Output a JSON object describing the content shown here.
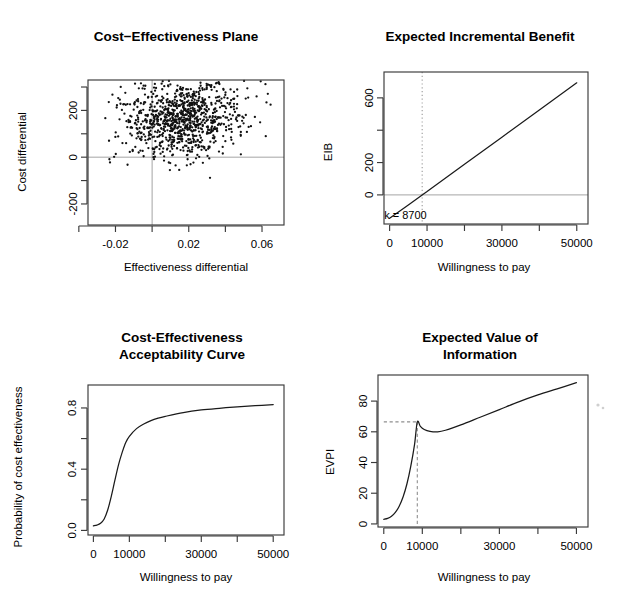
{
  "figure": {
    "background_color": "#ffffff",
    "foreground_color": "#000000",
    "grid_layout": "2x2",
    "reference_line_color": "#9a9a9a"
  },
  "chart_data": [
    {
      "id": "cost-effectiveness-plane",
      "type": "scatter",
      "title": "Cost−Effectiveness Plane",
      "xlabel": "Effectiveness differential",
      "ylabel": "Cost differential",
      "xlim": [
        -0.035,
        0.072
      ],
      "ylim": [
        -290,
        330
      ],
      "xticks": [
        -0.04,
        -0.02,
        0.0,
        0.02,
        0.04,
        0.06
      ],
      "xticklabels": [
        "",
        "-0.02",
        "",
        "0.02",
        "",
        "0.06"
      ],
      "yticks": [
        -200,
        -100,
        0,
        100,
        200,
        300
      ],
      "yticklabels": [
        "-200",
        "",
        "0",
        "",
        "200",
        ""
      ],
      "grid": false,
      "reference_lines": [
        {
          "orientation": "horizontal",
          "value": 0,
          "color": "#9a9a9a"
        },
        {
          "orientation": "vertical",
          "value": 0,
          "color": "#9a9a9a"
        }
      ],
      "cloud": {
        "n_points": 1000,
        "mean_x": 0.0165,
        "mean_y": 168,
        "sd_x": 0.0165,
        "sd_y": 83,
        "correlation": 0.12,
        "point_radius": 1.15,
        "point_color": "#111111"
      },
      "quadrant_summary": {
        "proportion_above_zero_cost": 0.88,
        "proportion_right_of_zero_effect": 0.8
      }
    },
    {
      "id": "expected-incremental-benefit",
      "type": "line",
      "title": "Expected Incremental Benefit",
      "xlabel": "Willingness to pay",
      "ylabel": "EIB",
      "xlim": [
        -1500,
        53000
      ],
      "ylim": [
        -180,
        760
      ],
      "xticks": [
        0,
        10000,
        20000,
        30000,
        40000,
        50000
      ],
      "xticklabels": [
        "0",
        "10000",
        "",
        "30000",
        "",
        "50000"
      ],
      "yticks": [
        0,
        200,
        400,
        600
      ],
      "yticklabels": [
        "0",
        "200",
        "",
        "600"
      ],
      "grid": false,
      "series": [
        {
          "name": "EIB",
          "x": [
            0,
            5000,
            8700,
            10000,
            20000,
            30000,
            40000,
            50000
          ],
          "values": [
            -145,
            -62,
            0,
            21,
            190,
            357,
            525,
            693
          ]
        }
      ],
      "reference_lines": [
        {
          "orientation": "horizontal",
          "value": 0,
          "style": "solid",
          "color": "#9a9a9a"
        },
        {
          "orientation": "vertical",
          "value": 8700,
          "style": "dotted",
          "color": "#9a9a9a"
        }
      ],
      "annotations": [
        {
          "text": "k = 8700",
          "x": 8700,
          "y": -150,
          "anchor": "start"
        }
      ]
    },
    {
      "id": "cost-effectiveness-acceptability-curve",
      "type": "line",
      "title": "Cost-Effectiveness\nAcceptability Curve",
      "title_line_1": "Cost-Effectiveness",
      "title_line_2": "Acceptability Curve",
      "xlabel": "Willingness to pay",
      "ylabel": "Probability of cost effectiveness",
      "xlim": [
        -1500,
        53000
      ],
      "ylim": [
        -0.03,
        0.95
      ],
      "xticks": [
        0,
        10000,
        20000,
        30000,
        40000,
        50000
      ],
      "xticklabels": [
        "0",
        "10000",
        "",
        "30000",
        "",
        "50000"
      ],
      "yticks": [
        0.0,
        0.2,
        0.4,
        0.6,
        0.8
      ],
      "yticklabels": [
        "0.0",
        "",
        "0.4",
        "",
        "0.8"
      ],
      "grid": false,
      "series": [
        {
          "name": "Probability of cost effectiveness",
          "x": [
            0,
            1000,
            2000,
            3000,
            4000,
            5000,
            6000,
            7000,
            8000,
            9000,
            10000,
            12000,
            14000,
            16000,
            18000,
            20000,
            25000,
            30000,
            35000,
            40000,
            45000,
            50000
          ],
          "values": [
            0.03,
            0.035,
            0.047,
            0.075,
            0.135,
            0.225,
            0.33,
            0.43,
            0.51,
            0.575,
            0.615,
            0.665,
            0.695,
            0.717,
            0.733,
            0.745,
            0.77,
            0.787,
            0.798,
            0.807,
            0.815,
            0.822
          ]
        }
      ]
    },
    {
      "id": "expected-value-of-information",
      "type": "line",
      "title": "Expected Value of\nInformation",
      "title_line_1": "Expected Value of",
      "title_line_2": "Information",
      "xlabel": "Willingness to pay",
      "ylabel": "EVPI",
      "xlim": [
        -1500,
        53000
      ],
      "ylim": [
        -2,
        97
      ],
      "xticks": [
        0,
        10000,
        20000,
        30000,
        40000,
        50000
      ],
      "xticklabels": [
        "0",
        "10000",
        "",
        "30000",
        "",
        "50000"
      ],
      "yticks": [
        0,
        20,
        40,
        60,
        80
      ],
      "yticklabels": [
        "0",
        "20",
        "40",
        "60",
        "80"
      ],
      "grid": false,
      "series": [
        {
          "name": "EVPI",
          "x": [
            0,
            1000,
            2000,
            3000,
            4000,
            5000,
            6000,
            7000,
            8000,
            8700,
            9500,
            10500,
            12000,
            14000,
            16000,
            20000,
            25000,
            30000,
            35000,
            40000,
            45000,
            50000
          ],
          "values": [
            3.0,
            3.6,
            5.0,
            7.5,
            11.5,
            17.5,
            26.0,
            37.5,
            52.0,
            66.5,
            63.5,
            61.5,
            60.3,
            60.0,
            61.0,
            64.5,
            69.5,
            74.5,
            79.5,
            84.0,
            88.0,
            92.0
          ]
        }
      ],
      "peak": {
        "x": 8700,
        "y": 66.5
      },
      "reference_lines": [
        {
          "orientation": "vertical",
          "value": 8700,
          "style": "dashed",
          "color": "#8f8f8f",
          "from": 0,
          "to": 66.5
        },
        {
          "orientation": "horizontal",
          "value": 66.5,
          "style": "dashed",
          "color": "#8f8f8f",
          "from": 0,
          "to": 8700
        }
      ]
    }
  ]
}
